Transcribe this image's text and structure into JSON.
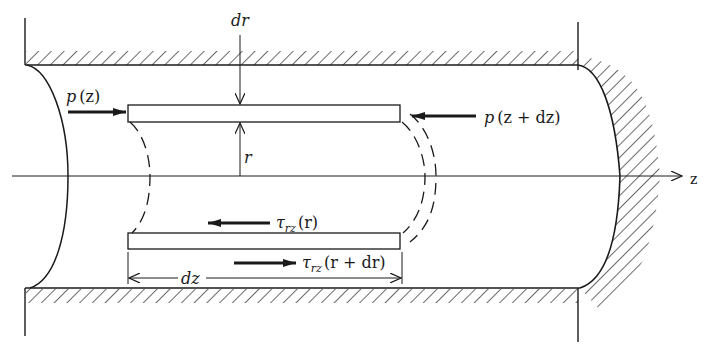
{
  "figure": {
    "colors": {
      "ink": "#1a1a1a",
      "background": "#ffffff"
    },
    "labels": {
      "dr": "dr",
      "r": "r",
      "dz": "dz",
      "z_axis": "z",
      "pressure_left": {
        "sym": "p",
        "arg": "(z)"
      },
      "pressure_right": {
        "sym": "p",
        "arg": "(z + dz)"
      },
      "shear_inner": {
        "sym": "τ",
        "sub": "rz",
        "arg": "(r)"
      },
      "shear_outer": {
        "sym": "τ",
        "sub": "rz",
        "arg": "(r + dr)"
      }
    },
    "elements": [
      "top wall (hatched)",
      "bottom wall (hatched)",
      "curved left end (inlet)",
      "curved right end cap (hatched)",
      "centerline axis z",
      "annular shell element of thickness dr and length dz",
      "dashed outline of shell ends"
    ]
  }
}
